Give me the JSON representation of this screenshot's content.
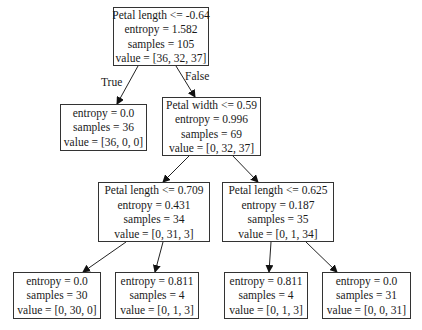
{
  "tree": {
    "nodes": [
      {
        "id": "root",
        "lines": [
          "Petal length <= -0.64",
          "entropy = 1.582",
          "samples = 105",
          "value = [36, 32, 37]"
        ]
      },
      {
        "id": "n1",
        "lines": [
          "entropy = 0.0",
          "samples = 36",
          "value = [36, 0, 0]"
        ]
      },
      {
        "id": "n2",
        "lines": [
          "Petal width <= 0.59",
          "entropy = 0.996",
          "samples = 69",
          "value = [0, 32, 37]"
        ]
      },
      {
        "id": "n3",
        "lines": [
          "Petal length <= 0.709",
          "entropy = 0.431",
          "samples = 34",
          "value = [0, 31, 3]"
        ]
      },
      {
        "id": "n4",
        "lines": [
          "Petal length <= 0.625",
          "entropy = 0.187",
          "samples = 35",
          "value = [0, 1, 34]"
        ]
      },
      {
        "id": "n5",
        "lines": [
          "entropy = 0.0",
          "samples = 30",
          "value = [0, 30, 0]"
        ]
      },
      {
        "id": "n6",
        "lines": [
          "entropy = 0.811",
          "samples = 4",
          "value = [0, 1, 3]"
        ]
      },
      {
        "id": "n7",
        "lines": [
          "entropy = 0.811",
          "samples = 4",
          "value = [0, 1, 3]"
        ]
      },
      {
        "id": "n8",
        "lines": [
          "entropy = 0.0",
          "samples = 31",
          "value = [0, 0, 31]"
        ]
      }
    ],
    "edge_labels": {
      "true": "True",
      "false": "False"
    }
  }
}
